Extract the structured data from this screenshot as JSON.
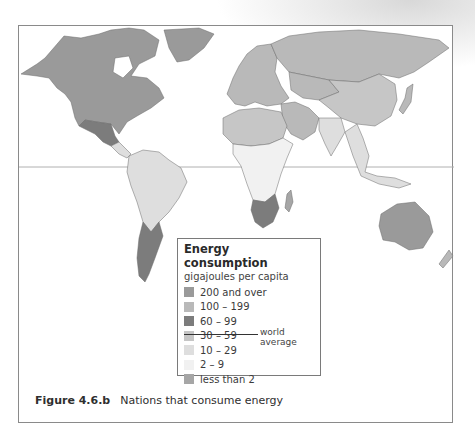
{
  "figure": {
    "number": "Figure 4.6.b",
    "title": "Nations that consume energy"
  },
  "legend": {
    "title": "Energy consumption",
    "unit": "gigajoules per capita",
    "items": [
      {
        "label": "200 and over",
        "color": "#9a9a9a"
      },
      {
        "label": "100 – 199",
        "color": "#b9b9b9"
      },
      {
        "label": "60 – 99",
        "color": "#7c7c7c"
      },
      {
        "label": "30 – 59",
        "color": "#c6c6c6"
      },
      {
        "label": "10 – 29",
        "color": "#dedede"
      },
      {
        "label": "2 – 9",
        "color": "#f1f1f1"
      },
      {
        "label": "less than 2",
        "color": "#a6a6a6"
      }
    ],
    "world_average_label": "world average"
  },
  "map": {
    "regions": [
      {
        "name": "north-america",
        "category": "200 and over"
      },
      {
        "name": "greenland",
        "category": "200 and over"
      },
      {
        "name": "mexico",
        "category": "60 – 99"
      },
      {
        "name": "central-america",
        "category": "10 – 29"
      },
      {
        "name": "south-america-north",
        "category": "10 – 29"
      },
      {
        "name": "argentina",
        "category": "60 – 99"
      },
      {
        "name": "europe",
        "category": "100 – 199"
      },
      {
        "name": "russia",
        "category": "100 – 199"
      },
      {
        "name": "middle-east",
        "category": "100 – 199"
      },
      {
        "name": "north-africa",
        "category": "30 – 59"
      },
      {
        "name": "central-africa",
        "category": "2 – 9"
      },
      {
        "name": "southern-africa",
        "category": "60 – 99"
      },
      {
        "name": "madagascar",
        "category": "less than 2"
      },
      {
        "name": "china",
        "category": "30 – 59"
      },
      {
        "name": "india",
        "category": "10 – 29"
      },
      {
        "name": "southeast-asia",
        "category": "10 – 29"
      },
      {
        "name": "japan",
        "category": "100 – 199"
      },
      {
        "name": "australia",
        "category": "200 and over"
      },
      {
        "name": "new-zealand",
        "category": "100 – 199"
      }
    ]
  }
}
